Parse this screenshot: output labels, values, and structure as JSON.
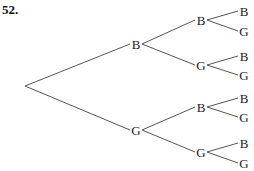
{
  "problem_number": "52.",
  "tree": {
    "root": {
      "x": 25,
      "y": 86
    },
    "level1": [
      {
        "label": "B",
        "x": 136,
        "y": 44
      },
      {
        "label": "G",
        "x": 136,
        "y": 130
      }
    ],
    "level2": [
      {
        "label": "B",
        "x": 201,
        "y": 20
      },
      {
        "label": "G",
        "x": 201,
        "y": 65
      },
      {
        "label": "B",
        "x": 201,
        "y": 107
      },
      {
        "label": "G",
        "x": 201,
        "y": 152
      }
    ],
    "leaves": [
      {
        "label": "B",
        "x": 244,
        "y": 11
      },
      {
        "label": "G",
        "x": 244,
        "y": 31
      },
      {
        "label": "B",
        "x": 244,
        "y": 56
      },
      {
        "label": "G",
        "x": 244,
        "y": 75
      },
      {
        "label": "B",
        "x": 244,
        "y": 98
      },
      {
        "label": "G",
        "x": 244,
        "y": 117
      },
      {
        "label": "B",
        "x": 244,
        "y": 143
      },
      {
        "label": "G",
        "x": 244,
        "y": 163
      }
    ]
  }
}
